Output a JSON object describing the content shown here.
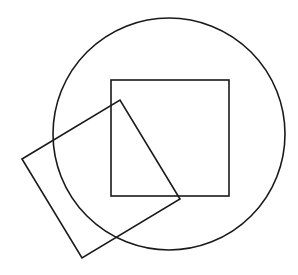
{
  "diagram": {
    "background": "#ffffff",
    "stroke_color": "#1a1a1a",
    "stroke_width": 1.6,
    "shapes": [
      {
        "type": "circle",
        "name": "large-circle",
        "cx": 169,
        "cy": 134,
        "r": 116
      },
      {
        "type": "square",
        "name": "axis-aligned-square",
        "x": 111,
        "y": 80,
        "width": 118,
        "height": 116
      },
      {
        "type": "polygon",
        "name": "rotated-square",
        "points": "22,159 120,100 180,199 82,258"
      }
    ]
  }
}
